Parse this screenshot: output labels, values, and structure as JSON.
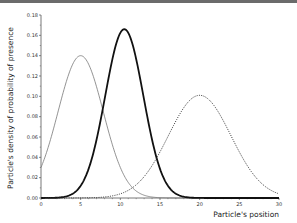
{
  "chart_data": {
    "type": "line",
    "title": "",
    "xlabel": "Particle's position",
    "ylabel": "Particle's density of probability of presence",
    "xlim": [
      0,
      30
    ],
    "ylim": [
      0,
      0.18
    ],
    "xticks": [
      0,
      5,
      10,
      15,
      20,
      25,
      30
    ],
    "xtick_labels": [
      "0",
      "5",
      "10",
      "15",
      "20",
      "25",
      "30"
    ],
    "yticks": [
      0.0,
      0.02,
      0.04,
      0.06,
      0.08,
      0.1,
      0.12,
      0.14,
      0.16,
      0.18
    ],
    "ytick_labels": [
      "0.00",
      "0.02",
      "0.04",
      "0.06",
      "0.08",
      "0.10",
      "0.12",
      "0.14",
      "0.16",
      "0.18"
    ],
    "grid": false,
    "legend": null,
    "series": [
      {
        "name": "gaussian-thin-grey",
        "style": "solid-thin",
        "color": "#777777",
        "mean": 5,
        "sigma": 2.85,
        "peak": 0.14
      },
      {
        "name": "gaussian-thick-black",
        "style": "solid-thick",
        "color": "#111111",
        "mean": 10.5,
        "sigma": 2.4,
        "peak": 0.166
      },
      {
        "name": "gaussian-dotted",
        "style": "dotted",
        "color": "#333333",
        "mean": 20,
        "sigma": 3.95,
        "peak": 0.101
      }
    ]
  }
}
